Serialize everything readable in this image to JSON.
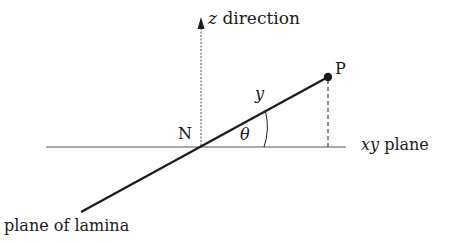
{
  "diagram": {
    "labels": {
      "z_axis_var": "z",
      "z_axis_text": "direction",
      "point": "P",
      "origin": "N",
      "distance": "y",
      "angle": "θ",
      "plane_var": "xy",
      "plane_text": "plane",
      "lamina": "plane of lamina"
    },
    "colors": {
      "line": "#1a1a1a",
      "thin_line": "#555555",
      "background": "#ffffff"
    }
  }
}
